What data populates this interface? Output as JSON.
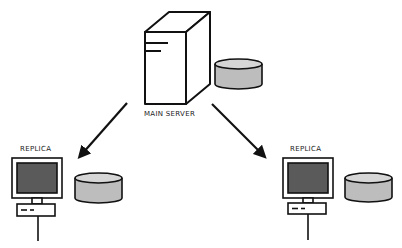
{
  "diagram": {
    "type": "database-replication",
    "nodes": [
      {
        "id": "main-server",
        "label": "MAIN SERVER",
        "kind": "server-tower",
        "has_database": true
      },
      {
        "id": "replica-left",
        "label": "REPLICA",
        "kind": "workstation",
        "has_database": true
      },
      {
        "id": "replica-right",
        "label": "REPLICA",
        "kind": "workstation",
        "has_database": true
      }
    ],
    "edges": [
      {
        "from": "main-server",
        "to": "replica-left",
        "style": "arrow"
      },
      {
        "from": "main-server",
        "to": "replica-right",
        "style": "arrow"
      }
    ],
    "colors": {
      "stroke": "#111111",
      "screen": "#5a5a5a",
      "database_body": "#bdbdbd",
      "database_top": "#d6d6d6",
      "background": "#ffffff"
    }
  },
  "labels": {
    "main_server": "MAIN SERVER",
    "replica_left": "REPLICA",
    "replica_right": "REPLICA"
  }
}
